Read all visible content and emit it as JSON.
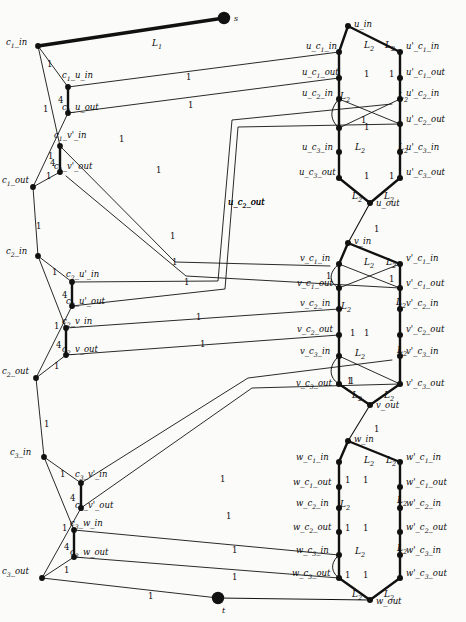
{
  "figure": {
    "source_node": "s",
    "sink_node": "t",
    "stroke_color": "#111111",
    "node_color": "#111111",
    "background": "#fbfbfa"
  },
  "capacities": {
    "one": "1",
    "four": "4",
    "L1": "L",
    "L1sub": "1",
    "L2": "L",
    "L2sub": "2"
  },
  "clause_nodes": [
    {
      "id": "c1_in",
      "label": "c",
      "sub": "1",
      "rest": "_in",
      "x": 38,
      "y": 46,
      "lx": 6,
      "ly": 38
    },
    {
      "id": "c1_u_in",
      "label": "c",
      "sub": "1",
      "rest": "_u_in",
      "x": 68,
      "y": 87,
      "lx": 62,
      "ly": 71
    },
    {
      "id": "c1_u_out",
      "label": "c",
      "sub": "1",
      "rest": "_u_out",
      "x": 68,
      "y": 113,
      "lx": 62,
      "ly": 103
    },
    {
      "id": "c1_v'_in",
      "label": "c",
      "sub": "1",
      "rest": "_v'_in",
      "x": 60,
      "y": 146,
      "lx": 54,
      "ly": 131
    },
    {
      "id": "c1_v'_out",
      "label": "c",
      "sub": "1",
      "rest": "_v'_out",
      "x": 60,
      "y": 172,
      "lx": 54,
      "ly": 162
    },
    {
      "id": "c1_out",
      "label": "c",
      "sub": "1",
      "rest": "_out",
      "x": 33,
      "y": 187,
      "lx": 2,
      "ly": 176
    },
    {
      "id": "c2_in",
      "label": "c",
      "sub": "2",
      "rest": "_in",
      "x": 38,
      "y": 256,
      "lx": 6,
      "ly": 247
    },
    {
      "id": "c2_u'_in",
      "label": "c",
      "sub": "2",
      "rest": "_u'_in",
      "x": 72,
      "y": 282,
      "lx": 66,
      "ly": 270
    },
    {
      "id": "c2_u'_out",
      "label": "c",
      "sub": "2",
      "rest": "_u'_out",
      "x": 72,
      "y": 306,
      "lx": 66,
      "ly": 297
    },
    {
      "id": "c2_v_in",
      "label": "c",
      "sub": "2",
      "rest": "_v_in",
      "x": 66,
      "y": 328,
      "lx": 62,
      "ly": 317
    },
    {
      "id": "c2_v_out",
      "label": "c",
      "sub": "2",
      "rest": "_v_out",
      "x": 66,
      "y": 355,
      "lx": 62,
      "ly": 345
    },
    {
      "id": "c2_out",
      "label": "c",
      "sub": "2",
      "rest": "_out",
      "x": 36,
      "y": 378,
      "lx": 2,
      "ly": 367
    },
    {
      "id": "c3_in",
      "label": "c",
      "sub": "3",
      "rest": "_in",
      "x": 44,
      "y": 457,
      "lx": 10,
      "ly": 448
    },
    {
      "id": "c3_v'_in",
      "label": "c",
      "sub": "3",
      "rest": "_v'_in",
      "x": 81,
      "y": 483,
      "lx": 75,
      "ly": 470
    },
    {
      "id": "c3_v'_out",
      "label": "c",
      "sub": "3",
      "rest": "_v'_out",
      "x": 81,
      "y": 508,
      "lx": 75,
      "ly": 501
    },
    {
      "id": "c3_w_in",
      "label": "c",
      "sub": "3",
      "rest": "_w_in",
      "x": 74,
      "y": 530,
      "lx": 70,
      "ly": 519
    },
    {
      "id": "c3_w_out",
      "label": "c",
      "sub": "3",
      "rest": "_w_out",
      "x": 74,
      "y": 557,
      "lx": 70,
      "ly": 548
    },
    {
      "id": "c3_out",
      "label": "c",
      "sub": "3",
      "rest": "_out",
      "x": 42,
      "y": 578,
      "lx": 2,
      "ly": 567
    }
  ],
  "variable_nodes": [
    {
      "id": "u_in",
      "label": "u",
      "sub": "",
      "rest": "_in",
      "x": 348,
      "y": 26,
      "lx": 354,
      "ly": 20
    },
    {
      "id": "u_c1_in",
      "label": "u",
      "sub": "",
      "rest": "_c_1_in",
      "x": 339,
      "y": 52,
      "lx": 306,
      "ly": 42
    },
    {
      "id": "u_c1_out",
      "label": "u",
      "sub": "",
      "rest": "_c_1_out",
      "x": 339,
      "y": 78,
      "lx": 302,
      "ly": 68
    },
    {
      "id": "u_c2_in",
      "label": "u",
      "sub": "",
      "rest": "_c_2_in",
      "x": 339,
      "y": 99,
      "lx": 302,
      "ly": 89
    },
    {
      "id": "u_c2_outN",
      "label": "u",
      "sub": "",
      "rest": "_c_2_out",
      "x": 339,
      "y": 128,
      "lx": 228,
      "ly": 198
    },
    {
      "id": "u_c3_in",
      "label": "u",
      "sub": "",
      "rest": "_c_3_in",
      "x": 339,
      "y": 152,
      "lx": 302,
      "ly": 143
    },
    {
      "id": "u_c3_out",
      "label": "u",
      "sub": "",
      "rest": "_c_3_out",
      "x": 339,
      "y": 178,
      "lx": 299,
      "ly": 168
    },
    {
      "id": "u_out",
      "label": "u",
      "sub": "",
      "rest": "_out",
      "x": 370,
      "y": 203,
      "lx": 376,
      "ly": 199
    },
    {
      "id": "u'_c1_in",
      "label": "u'",
      "sub": "",
      "rest": "_c_1_in",
      "x": 400,
      "y": 52,
      "lx": 406,
      "ly": 42
    },
    {
      "id": "u'_c1_out",
      "label": "u'",
      "sub": "",
      "rest": "_c_1_out",
      "x": 400,
      "y": 78,
      "lx": 406,
      "ly": 68
    },
    {
      "id": "u'_c2_in",
      "label": "u'",
      "sub": "",
      "rest": "_c_2_in",
      "x": 400,
      "y": 99,
      "lx": 406,
      "ly": 89
    },
    {
      "id": "u'_c2_out",
      "label": "u'",
      "sub": "",
      "rest": "_c_2_out",
      "x": 400,
      "y": 124,
      "lx": 406,
      "ly": 115
    },
    {
      "id": "u'_c3_in",
      "label": "u'",
      "sub": "",
      "rest": "_c_3_in",
      "x": 400,
      "y": 152,
      "lx": 406,
      "ly": 143
    },
    {
      "id": "u'_c3_out",
      "label": "u'",
      "sub": "",
      "rest": "_c_3_out",
      "x": 400,
      "y": 178,
      "lx": 406,
      "ly": 168
    },
    {
      "id": "v_in",
      "label": "v",
      "sub": "",
      "rest": "_in",
      "x": 348,
      "y": 243,
      "lx": 354,
      "ly": 237
    },
    {
      "id": "v_c1_in",
      "label": "v",
      "sub": "",
      "rest": "_c_1_in",
      "x": 339,
      "y": 264,
      "lx": 300,
      "ly": 254
    },
    {
      "id": "v_c1_out",
      "label": "v",
      "sub": "",
      "rest": "_c_1_out",
      "x": 339,
      "y": 288,
      "lx": 297,
      "ly": 279
    },
    {
      "id": "v_c2_in",
      "label": "v",
      "sub": "",
      "rest": "_c_2_in",
      "x": 339,
      "y": 309,
      "lx": 300,
      "ly": 299
    },
    {
      "id": "v_c2_out",
      "label": "v",
      "sub": "",
      "rest": "_c_2_out",
      "x": 339,
      "y": 335,
      "lx": 297,
      "ly": 325
    },
    {
      "id": "v_c3_in",
      "label": "v",
      "sub": "",
      "rest": "_c_3_in",
      "x": 339,
      "y": 356,
      "lx": 300,
      "ly": 347
    },
    {
      "id": "v_c3_out",
      "label": "v",
      "sub": "",
      "rest": "_c_3_out",
      "x": 339,
      "y": 384,
      "lx": 296,
      "ly": 379
    },
    {
      "id": "v_out",
      "label": "v",
      "sub": "",
      "rest": "_out",
      "x": 370,
      "y": 405,
      "lx": 376,
      "ly": 401
    },
    {
      "id": "v'_c1_in",
      "label": "v'",
      "sub": "",
      "rest": "_c_1_in",
      "x": 400,
      "y": 264,
      "lx": 406,
      "ly": 254
    },
    {
      "id": "v'_c1_out",
      "label": "v'",
      "sub": "",
      "rest": "_c_1_out",
      "x": 400,
      "y": 288,
      "lx": 406,
      "ly": 279
    },
    {
      "id": "v'_c2_in",
      "label": "v'",
      "sub": "",
      "rest": "_c_2_in",
      "x": 400,
      "y": 309,
      "lx": 406,
      "ly": 299
    },
    {
      "id": "v'_c2_out",
      "label": "v'",
      "sub": "",
      "rest": "_c_2_out",
      "x": 400,
      "y": 335,
      "lx": 406,
      "ly": 325
    },
    {
      "id": "v'_c3_in",
      "label": "v'",
      "sub": "",
      "rest": "_c_3_in",
      "x": 400,
      "y": 356,
      "lx": 406,
      "ly": 347
    },
    {
      "id": "v'_c3_out",
      "label": "v'",
      "sub": "",
      "rest": "_c_3_out",
      "x": 400,
      "y": 384,
      "lx": 406,
      "ly": 379
    },
    {
      "id": "w_in",
      "label": "w",
      "sub": "",
      "rest": "_in",
      "x": 348,
      "y": 441,
      "lx": 354,
      "ly": 435
    },
    {
      "id": "w_c1_in",
      "label": "w",
      "sub": "",
      "rest": "_c_1_in",
      "x": 339,
      "y": 462,
      "lx": 296,
      "ly": 453
    },
    {
      "id": "w_c1_out",
      "label": "w",
      "sub": "",
      "rest": "_c_1_out",
      "x": 339,
      "y": 487,
      "lx": 293,
      "ly": 478
    },
    {
      "id": "w_c2_in",
      "label": "w",
      "sub": "",
      "rest": "_c_2_in",
      "x": 339,
      "y": 508,
      "lx": 296,
      "ly": 499
    },
    {
      "id": "w_c2_out",
      "label": "w",
      "sub": "",
      "rest": "_c_2_out",
      "x": 339,
      "y": 532,
      "lx": 293,
      "ly": 523
    },
    {
      "id": "w_c3_in",
      "label": "w",
      "sub": "",
      "rest": "_c_3_in",
      "x": 339,
      "y": 555,
      "lx": 296,
      "ly": 546
    },
    {
      "id": "w_c3_out",
      "label": "w",
      "sub": "",
      "rest": "_c_3_out",
      "x": 339,
      "y": 578,
      "lx": 292,
      "ly": 569
    },
    {
      "id": "w_out",
      "label": "w",
      "sub": "",
      "rest": "_out",
      "x": 370,
      "y": 600,
      "lx": 376,
      "ly": 597
    },
    {
      "id": "w'_c1_in",
      "label": "w'",
      "sub": "",
      "rest": "_c_1_in",
      "x": 400,
      "y": 462,
      "lx": 406,
      "ly": 453
    },
    {
      "id": "w'_c1_out",
      "label": "w'",
      "sub": "",
      "rest": "_c_1_out",
      "x": 400,
      "y": 487,
      "lx": 406,
      "ly": 478
    },
    {
      "id": "w'_c2_in",
      "label": "w'",
      "sub": "",
      "rest": "_c_2_in",
      "x": 400,
      "y": 508,
      "lx": 406,
      "ly": 499
    },
    {
      "id": "w'_c2_out",
      "label": "w'",
      "sub": "",
      "rest": "_c_2_out",
      "x": 400,
      "y": 532,
      "lx": 406,
      "ly": 523
    },
    {
      "id": "w'_c3_in",
      "label": "w'",
      "sub": "",
      "rest": "_c_3_in",
      "x": 400,
      "y": 555,
      "lx": 406,
      "ly": 546
    },
    {
      "id": "w'_c3_out",
      "label": "w'",
      "sub": "",
      "rest": "_c_3_out",
      "x": 400,
      "y": 578,
      "lx": 406,
      "ly": 569
    }
  ],
  "terminals": [
    {
      "id": "s",
      "label": "s",
      "x": 224,
      "y": 18,
      "lx": 234,
      "ly": 14
    },
    {
      "id": "t",
      "label": "t",
      "x": 218,
      "y": 598,
      "lx": 222,
      "ly": 606
    }
  ],
  "edge_capacity_labels": [
    {
      "t": "1",
      "x": 47,
      "y": 60
    },
    {
      "t": "1",
      "x": 43,
      "y": 105
    },
    {
      "t": "4",
      "x": 58,
      "y": 96
    },
    {
      "t": "1",
      "x": 48,
      "y": 152
    },
    {
      "t": "4",
      "x": 50,
      "y": 159
    },
    {
      "t": "1",
      "x": 46,
      "y": 172
    },
    {
      "t": "1",
      "x": 36,
      "y": 222
    },
    {
      "t": "1",
      "x": 52,
      "y": 268
    },
    {
      "t": "4",
      "x": 62,
      "y": 291
    },
    {
      "t": "1",
      "x": 54,
      "y": 322
    },
    {
      "t": "4",
      "x": 56,
      "y": 341
    },
    {
      "t": "1",
      "x": 54,
      "y": 362
    },
    {
      "t": "1",
      "x": 44,
      "y": 420
    },
    {
      "t": "1",
      "x": 60,
      "y": 470
    },
    {
      "t": "4",
      "x": 70,
      "y": 494
    },
    {
      "t": "1",
      "x": 62,
      "y": 524
    },
    {
      "t": "4",
      "x": 64,
      "y": 543
    },
    {
      "t": "1",
      "x": 64,
      "y": 566
    },
    {
      "t": "1",
      "x": 119,
      "y": 135
    },
    {
      "t": "1",
      "x": 186,
      "y": 73
    },
    {
      "t": "1",
      "x": 188,
      "y": 101
    },
    {
      "t": "1",
      "x": 156,
      "y": 166
    },
    {
      "t": "1",
      "x": 170,
      "y": 232
    },
    {
      "t": "1",
      "x": 172,
      "y": 258
    },
    {
      "t": "1",
      "x": 184,
      "y": 278
    },
    {
      "t": "1",
      "x": 196,
      "y": 313
    },
    {
      "t": "1",
      "x": 200,
      "y": 340
    },
    {
      "t": "1",
      "x": 220,
      "y": 475
    },
    {
      "t": "1",
      "x": 226,
      "y": 512
    },
    {
      "t": "1",
      "x": 232,
      "y": 546
    },
    {
      "t": "1",
      "x": 232,
      "y": 573
    },
    {
      "t": "1",
      "x": 148,
      "y": 592
    },
    {
      "t": "1",
      "x": 364,
      "y": 70
    },
    {
      "t": "1",
      "x": 364,
      "y": 123
    },
    {
      "t": "1",
      "x": 364,
      "y": 172
    },
    {
      "t": "1",
      "x": 389,
      "y": 70
    },
    {
      "t": "1",
      "x": 361,
      "y": 116
    },
    {
      "t": "1",
      "x": 389,
      "y": 172
    },
    {
      "t": "1",
      "x": 374,
      "y": 225
    },
    {
      "t": "1",
      "x": 326,
      "y": 272
    },
    {
      "t": "1",
      "x": 364,
      "y": 329
    },
    {
      "t": "1",
      "x": 347,
      "y": 377
    },
    {
      "t": "1",
      "x": 389,
      "y": 275
    },
    {
      "t": "1",
      "x": 350,
      "y": 329
    },
    {
      "t": "1",
      "x": 349,
      "y": 377
    },
    {
      "t": "1",
      "x": 374,
      "y": 425
    },
    {
      "t": "1",
      "x": 363,
      "y": 476
    },
    {
      "t": "1",
      "x": 363,
      "y": 524
    },
    {
      "t": "1",
      "x": 363,
      "y": 571
    },
    {
      "t": "1",
      "x": 345,
      "y": 476
    },
    {
      "t": "1",
      "x": 345,
      "y": 524
    },
    {
      "t": "1",
      "x": 345,
      "y": 571
    }
  ],
  "edge_L_labels": [
    {
      "base": "L",
      "sub": "1",
      "x": 152,
      "y": 39
    },
    {
      "base": "L",
      "sub": "2",
      "x": 364,
      "y": 41
    },
    {
      "base": "L",
      "sub": "2",
      "x": 385,
      "y": 41
    },
    {
      "base": "L",
      "sub": "2",
      "x": 340,
      "y": 92
    },
    {
      "base": "L",
      "sub": "2",
      "x": 398,
      "y": 92
    },
    {
      "base": "L",
      "sub": "2",
      "x": 355,
      "y": 143
    },
    {
      "base": "L",
      "sub": "2",
      "x": 398,
      "y": 143
    },
    {
      "base": "L",
      "sub": "2",
      "x": 352,
      "y": 192
    },
    {
      "base": "L",
      "sub": "2",
      "x": 384,
      "y": 192
    },
    {
      "base": "L",
      "sub": "2",
      "x": 364,
      "y": 258
    },
    {
      "base": "L",
      "sub": "2",
      "x": 386,
      "y": 258
    },
    {
      "base": "L",
      "sub": "2",
      "x": 341,
      "y": 302
    },
    {
      "base": "L",
      "sub": "2",
      "x": 396,
      "y": 298
    },
    {
      "base": "L",
      "sub": "2",
      "x": 355,
      "y": 349
    },
    {
      "base": "L",
      "sub": "2",
      "x": 397,
      "y": 346
    },
    {
      "base": "L",
      "sub": "2",
      "x": 352,
      "y": 391
    },
    {
      "base": "L",
      "sub": "2",
      "x": 384,
      "y": 391
    },
    {
      "base": "L",
      "sub": "2",
      "x": 364,
      "y": 456
    },
    {
      "base": "L",
      "sub": "2",
      "x": 386,
      "y": 456
    },
    {
      "base": "L",
      "sub": "2",
      "x": 340,
      "y": 500
    },
    {
      "base": "L",
      "sub": "2",
      "x": 397,
      "y": 496
    },
    {
      "base": "L",
      "sub": "2",
      "x": 355,
      "y": 547
    },
    {
      "base": "L",
      "sub": "2",
      "x": 397,
      "y": 544
    },
    {
      "base": "L",
      "sub": "2",
      "x": 352,
      "y": 590
    },
    {
      "base": "L",
      "sub": "2",
      "x": 384,
      "y": 590
    }
  ],
  "floating_labels": [
    {
      "text": "u_c_2_out",
      "base": "u",
      "rest": "_c",
      "sub": "2",
      "tail": "_out",
      "x": 228,
      "y": 198
    }
  ]
}
